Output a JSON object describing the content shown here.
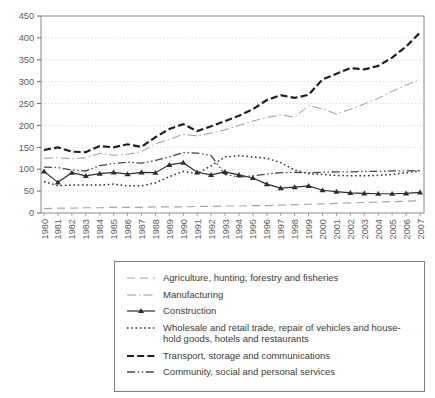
{
  "chart_data": {
    "type": "line",
    "title": "",
    "xlabel": "",
    "ylabel": "",
    "x": [
      1980,
      1981,
      1982,
      1983,
      1984,
      1985,
      1986,
      1987,
      1988,
      1989,
      1990,
      1991,
      1992,
      1993,
      1994,
      1995,
      1996,
      1997,
      1998,
      1999,
      2000,
      2001,
      2002,
      2003,
      2004,
      2005,
      2006,
      2007
    ],
    "ylim": [
      0,
      450
    ],
    "yticks": [
      0,
      50,
      100,
      150,
      200,
      250,
      300,
      350,
      400,
      450
    ],
    "grid": "horizontal dotted",
    "legend_position": "bottom boxed",
    "series": [
      {
        "name": "Agriculture, hunting, forestry and fisheries",
        "line_style": "longdash",
        "color": "#a6a6a6",
        "stroke_width": 1.2,
        "marker": "none",
        "values": [
          10,
          11,
          11,
          12,
          12,
          13,
          13,
          13,
          14,
          14,
          14,
          15,
          15,
          16,
          16,
          17,
          17,
          18,
          19,
          20,
          21,
          22,
          23,
          24,
          25,
          26,
          27,
          28
        ]
      },
      {
        "name": "Manufacturing",
        "line_style": "dashdot",
        "color": "#9a9a9a",
        "stroke_width": 1,
        "marker": "none",
        "values": [
          125,
          126,
          124,
          126,
          136,
          132,
          134,
          140,
          158,
          168,
          180,
          176,
          183,
          190,
          200,
          210,
          218,
          224,
          219,
          245,
          238,
          226,
          237,
          249,
          262,
          278,
          292,
          305
        ]
      },
      {
        "name": "Construction",
        "line_style": "solid",
        "color": "#2e2e2e",
        "stroke_width": 1.2,
        "marker": "triangle",
        "values": [
          95,
          70,
          92,
          85,
          90,
          93,
          89,
          93,
          92,
          110,
          115,
          93,
          87,
          94,
          87,
          80,
          66,
          57,
          59,
          62,
          52,
          49,
          46,
          45,
          44,
          44,
          45,
          47
        ]
      },
      {
        "name": "Wholesale and retail trade, repair of vehicles and household goods, hotels and restaurants",
        "name_line1": "Wholesale and retail trade, repair of vehicles and house-",
        "name_line2": "hold goods, hotels and restaurants",
        "line_style": "dotted",
        "color": "#303030",
        "stroke_width": 1.5,
        "marker": "none",
        "values": [
          72,
          62,
          64,
          64,
          64,
          66,
          62,
          62,
          69,
          83,
          95,
          90,
          108,
          128,
          131,
          128,
          125,
          115,
          98,
          90,
          88,
          86,
          85,
          85,
          86,
          88,
          92,
          96
        ]
      },
      {
        "name": "Transport, storage and communications",
        "line_style": "bolddash",
        "color": "#1f1f1f",
        "stroke_width": 2.2,
        "marker": "none",
        "values": [
          144,
          150,
          140,
          139,
          153,
          150,
          157,
          151,
          173,
          192,
          203,
          187,
          198,
          210,
          222,
          237,
          258,
          269,
          263,
          270,
          305,
          318,
          331,
          328,
          336,
          355,
          380,
          412
        ]
      },
      {
        "name": "Community, social and personal services",
        "line_style": "dashdotdot",
        "color": "#474747",
        "stroke_width": 1.3,
        "marker": "none",
        "values": [
          105,
          104,
          98,
          96,
          108,
          113,
          116,
          114,
          120,
          128,
          138,
          137,
          131,
          88,
          82,
          85,
          89,
          92,
          93,
          92,
          93,
          94,
          94,
          95,
          95,
          96,
          96,
          97
        ]
      }
    ]
  }
}
